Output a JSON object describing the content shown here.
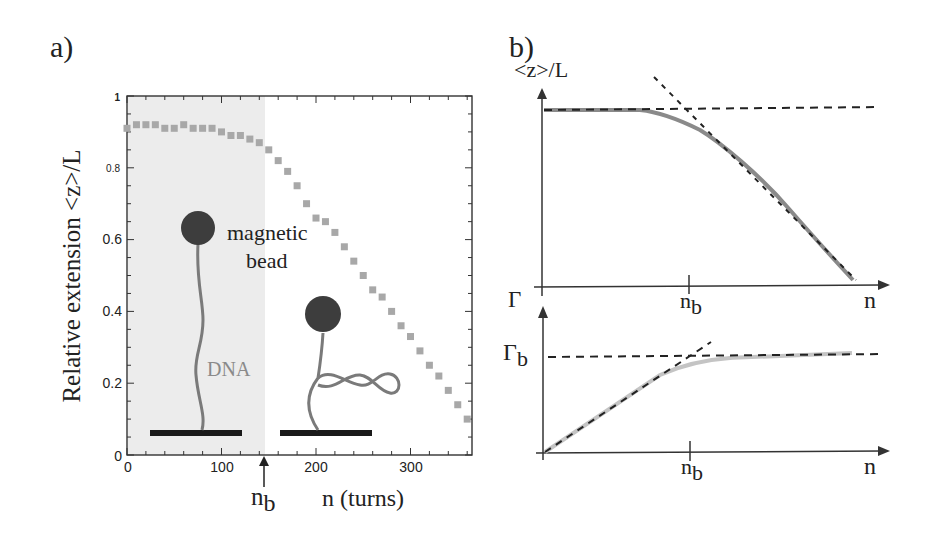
{
  "panel_a": {
    "label": "a)",
    "ylabel": "Relative extension <z>/L",
    "xlabel": "n (turns)",
    "x_ticks": [
      "0",
      "100",
      "200",
      "300"
    ],
    "y_ticks": [
      "0",
      "0.2",
      "0.4",
      "0.6",
      "0.8",
      "1"
    ],
    "arrow_label": "n",
    "arrow_label_sub": "b",
    "annotation_bead": "magnetic",
    "annotation_bead2": "bead",
    "annotation_dna": "DNA"
  },
  "panel_b": {
    "label": "b)",
    "top_ylabel": "<z>/L",
    "top_xlabel": "n",
    "top_tick_label": "n",
    "top_tick_label_sub": "b",
    "bottom_ylabel": "Γ",
    "bottom_level_label": "Γ",
    "bottom_level_label_sub": "b",
    "bottom_xlabel": "n",
    "bottom_tick_label": "n",
    "bottom_tick_label_sub": "b"
  },
  "colors": {
    "markers": "#a8a8a8",
    "shade": "#ececec",
    "curve_top": "#8a8a8a",
    "curve_bottom": "#c4c4c4",
    "dashed": "#222222",
    "bead": "#3d3d3d",
    "dna": "#7a7a7a",
    "surface": "#1a1a1a"
  },
  "chart_data": [
    {
      "type": "scatter",
      "title": "a)",
      "xlabel": "n (turns)",
      "ylabel": "Relative extension <z>/L",
      "xlim": [
        0,
        370
      ],
      "ylim": [
        0,
        1
      ],
      "x_ticks": [
        0,
        100,
        200,
        300
      ],
      "y_ticks": [
        0,
        0.2,
        0.4,
        0.6,
        0.8,
        1
      ],
      "shaded_region": [
        0,
        145
      ],
      "annotations": [
        "magnetic bead",
        "DNA",
        "n_b (arrow at n≈145)"
      ],
      "series": [
        {
          "name": "measured extension",
          "x": [
            0,
            10,
            20,
            30,
            40,
            50,
            60,
            70,
            80,
            90,
            100,
            110,
            120,
            130,
            140,
            150,
            160,
            170,
            180,
            190,
            200,
            210,
            220,
            230,
            240,
            250,
            260,
            270,
            280,
            290,
            300,
            310,
            320,
            330,
            340,
            350,
            360
          ],
          "y": [
            0.91,
            0.92,
            0.92,
            0.92,
            0.91,
            0.91,
            0.92,
            0.91,
            0.91,
            0.91,
            0.9,
            0.89,
            0.89,
            0.88,
            0.87,
            0.85,
            0.82,
            0.79,
            0.75,
            0.7,
            0.66,
            0.65,
            0.62,
            0.58,
            0.54,
            0.5,
            0.46,
            0.44,
            0.4,
            0.36,
            0.33,
            0.29,
            0.25,
            0.22,
            0.18,
            0.14,
            0.1
          ]
        }
      ]
    },
    {
      "type": "line",
      "title": "b) top",
      "xlabel": "n",
      "ylabel": "<z>/L",
      "x_ticks": [
        "n_b"
      ],
      "series": [
        {
          "name": "extension curve (schematic)",
          "shape": "flat plateau then linear decrease after n_b"
        },
        {
          "name": "plateau asymptote",
          "style": "dashed horizontal"
        },
        {
          "name": "linear asymptote",
          "style": "dashed sloped"
        }
      ]
    },
    {
      "type": "line",
      "title": "b) bottom",
      "xlabel": "n",
      "ylabel": "Γ",
      "x_ticks": [
        "n_b"
      ],
      "y_ticks": [
        "Γ_b"
      ],
      "series": [
        {
          "name": "torque curve (schematic)",
          "shape": "linear rise then saturation at Γ_b after n_b"
        },
        {
          "name": "linear asymptote",
          "style": "dashed sloped"
        },
        {
          "name": "saturation level Γ_b",
          "style": "dashed horizontal"
        }
      ]
    }
  ]
}
